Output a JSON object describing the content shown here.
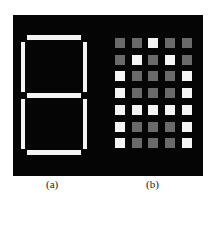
{
  "figure": {
    "labels": {
      "a": "(a)",
      "b": "(b)"
    },
    "colors": {
      "background": "#050505",
      "lit": "#f4f4f4",
      "unlit": "#6a6a6a"
    },
    "seven_segment": {
      "segments": [
        "a",
        "b",
        "c",
        "d",
        "e",
        "f",
        "g"
      ],
      "lit_all": true
    },
    "dot_matrix": {
      "rows": 7,
      "cols": 5,
      "character": "A",
      "grid": [
        [
          0,
          0,
          1,
          0,
          0
        ],
        [
          0,
          1,
          0,
          1,
          0
        ],
        [
          1,
          0,
          0,
          0,
          1
        ],
        [
          1,
          0,
          0,
          0,
          1
        ],
        [
          1,
          1,
          1,
          1,
          1
        ],
        [
          1,
          0,
          0,
          0,
          1
        ],
        [
          1,
          0,
          0,
          0,
          1
        ]
      ]
    }
  }
}
